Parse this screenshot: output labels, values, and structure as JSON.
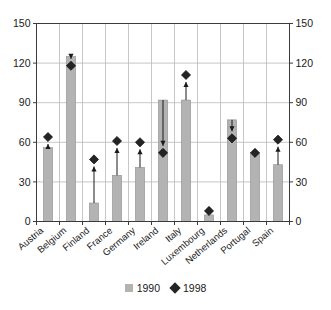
{
  "chart_data": {
    "type": "bar",
    "title": "",
    "subtitle": "",
    "xlabel": "",
    "ylabel": "",
    "ylim": [
      0,
      150
    ],
    "y_ticks": [
      0,
      30,
      60,
      90,
      120,
      150
    ],
    "grid": true,
    "dual_y_axis": true,
    "legend_position": "bottom",
    "categories": [
      "Austria",
      "Belgium",
      "Finland",
      "France",
      "Germany",
      "Ireland",
      "Italy",
      "Luxembourg",
      "Netherlands",
      "Portugal",
      "Spain"
    ],
    "series": [
      {
        "name": "1990",
        "marker": "bar",
        "color": "#b3b3b3",
        "values": [
          56,
          125,
          14,
          35,
          41,
          92,
          92,
          5,
          77,
          52,
          43
        ]
      },
      {
        "name": "1998",
        "marker": "diamond",
        "color": "#242424",
        "values": [
          64,
          118,
          47,
          61,
          60,
          52,
          111,
          8,
          63,
          52,
          62
        ]
      }
    ],
    "annotations": [
      {
        "category": "Austria",
        "direction": "up",
        "from": 56,
        "to": 64
      },
      {
        "category": "Belgium",
        "direction": "down",
        "from": 125,
        "to": 118
      },
      {
        "category": "Finland",
        "direction": "up",
        "from": 14,
        "to": 47
      },
      {
        "category": "France",
        "direction": "up",
        "from": 35,
        "to": 61
      },
      {
        "category": "Germany",
        "direction": "up",
        "from": 41,
        "to": 60
      },
      {
        "category": "Ireland",
        "direction": "down",
        "from": 92,
        "to": 52
      },
      {
        "category": "Italy",
        "direction": "up",
        "from": 92,
        "to": 111
      },
      {
        "category": "Luxembourg",
        "direction": "up",
        "from": 5,
        "to": 8
      },
      {
        "category": "Netherlands",
        "direction": "down",
        "from": 77,
        "to": 63
      },
      {
        "category": "Portugal",
        "direction": "none",
        "from": 52,
        "to": 52
      },
      {
        "category": "Spain",
        "direction": "up",
        "from": 43,
        "to": 62
      }
    ]
  },
  "axis": {
    "left_ticks": [
      "150",
      "120",
      "90",
      "60",
      "30",
      "0"
    ],
    "right_ticks": [
      "150",
      "120",
      "90",
      "60",
      "30",
      "0"
    ]
  },
  "legend": {
    "items": [
      {
        "label": "1990",
        "swatch": "square-swatch-icon"
      },
      {
        "label": "1998",
        "swatch": "diamond-swatch-icon"
      }
    ]
  }
}
